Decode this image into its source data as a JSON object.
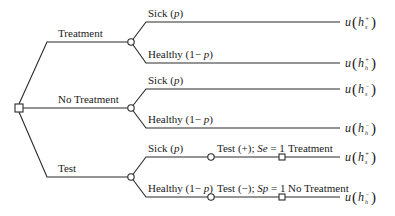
{
  "diagram": {
    "type": "decision-tree",
    "decision_node": {
      "kind": "decision"
    },
    "strategies": [
      {
        "label": "Treatment",
        "outcomes": [
          {
            "label": "Sick (p)",
            "label_parts": [
              "Sick (",
              "p",
              ")"
            ],
            "utility": {
              "fn": "u",
              "var": "h",
              "sup": "+",
              "sub": "s"
            }
          },
          {
            "label": "Healthy (1− p)",
            "label_parts": [
              "Healthy (1− ",
              "p",
              ")"
            ],
            "utility": {
              "fn": "u",
              "var": "h",
              "sup": "+",
              "sub": "h"
            }
          }
        ]
      },
      {
        "label": "No Treatment",
        "outcomes": [
          {
            "label": "Sick (p)",
            "label_parts": [
              "Sick (",
              "p",
              ")"
            ],
            "utility": {
              "fn": "u",
              "var": "h",
              "sup": "−",
              "sub": "s"
            }
          },
          {
            "label": "Healthy (1− p)",
            "label_parts": [
              "Healthy (1− ",
              "p",
              ")"
            ],
            "utility": {
              "fn": "u",
              "var": "h",
              "sup": "−",
              "sub": "h"
            }
          }
        ]
      },
      {
        "label": "Test",
        "outcomes": [
          {
            "label": "Sick (p)",
            "label_parts": [
              "Sick (",
              "p",
              ")"
            ],
            "test_result": {
              "label": "Test (+); Se = 1",
              "parts": [
                "Test (+); ",
                "Se",
                " = 1"
              ]
            },
            "action": "Treatment",
            "utility": {
              "fn": "u",
              "var": "h",
              "sup": "+",
              "sub": "s"
            }
          },
          {
            "label": "Healthy (1− p)",
            "label_parts": [
              "Healthy (1− ",
              "p",
              ")"
            ],
            "test_result": {
              "label": "Test (−); Sp = 1",
              "parts": [
                "Test (−); ",
                "Sp",
                " = 1"
              ]
            },
            "action": "No Treatment",
            "utility": {
              "fn": "u",
              "var": "h",
              "sup": "−",
              "sub": "h"
            }
          }
        ]
      }
    ],
    "colors": {
      "line": "#2a2a2a",
      "text": "#1a1a1a",
      "background": "#ffffff"
    }
  }
}
